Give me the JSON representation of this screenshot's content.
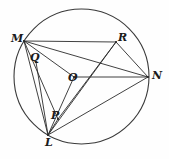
{
  "figure": {
    "type": "geometry-diagram",
    "canvas": {
      "width": 169,
      "height": 159
    },
    "background_color": "#fefefe",
    "stroke_color": "#2b2b2b",
    "label_color": "#1b1b1b"
  },
  "circle": {
    "name": "main-circle",
    "center": {
      "x": 81.5,
      "y": 76.5
    },
    "radius": 67.5,
    "stroke_color": "#3a3a3a"
  },
  "points": [
    {
      "id": "M",
      "label": "M",
      "x": 24,
      "y": 41,
      "label_x": 11,
      "label_y": 33,
      "on_circle": true
    },
    {
      "id": "R",
      "label": "R",
      "x": 116,
      "y": 42,
      "label_x": 118,
      "label_y": 32,
      "on_circle": true
    },
    {
      "id": "N",
      "label": "N",
      "x": 148,
      "y": 77,
      "label_x": 152,
      "label_y": 70,
      "on_circle": true
    },
    {
      "id": "L",
      "label": "L",
      "x": 48,
      "y": 135,
      "label_x": 45,
      "label_y": 137,
      "on_circle": true
    },
    {
      "id": "Q",
      "label": "Q",
      "x": 36,
      "y": 62,
      "label_x": 30,
      "label_y": 52,
      "on_circle": false
    },
    {
      "id": "O",
      "label": "O",
      "x": 74,
      "y": 77,
      "label_x": 68,
      "label_y": 72,
      "on_circle": false
    },
    {
      "id": "P",
      "label": "P",
      "x": 58,
      "y": 119,
      "label_x": 51,
      "label_y": 110,
      "on_circle": false
    }
  ],
  "segments": [
    {
      "name": "segment-M-R",
      "from": "M",
      "to": "R"
    },
    {
      "name": "segment-M-N",
      "from": "M",
      "to": "N"
    },
    {
      "name": "segment-M-O",
      "from": "M",
      "to": "O"
    },
    {
      "name": "segment-M-P",
      "from": "M",
      "to": "P"
    },
    {
      "name": "segment-M-L",
      "from": "M",
      "to": "L"
    },
    {
      "name": "segment-O-N",
      "from": "O",
      "to": "N"
    },
    {
      "name": "segment-R-N",
      "from": "R",
      "to": "N"
    },
    {
      "name": "segment-R-L",
      "from": "R",
      "to": "L"
    },
    {
      "name": "segment-R-P",
      "from": "R",
      "to": "P"
    },
    {
      "name": "segment-L-N",
      "from": "L",
      "to": "N"
    },
    {
      "name": "segment-L-O",
      "from": "L",
      "to": "O"
    },
    {
      "name": "segment-Q-L",
      "from": "Q",
      "to": "L"
    },
    {
      "name": "segment-P-L",
      "from": "P",
      "to": "L"
    }
  ]
}
